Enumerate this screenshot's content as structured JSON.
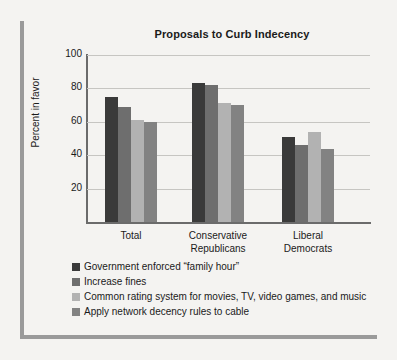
{
  "chart_data": {
    "type": "bar",
    "title": "Proposals to Curb Indecency",
    "xlabel": "",
    "ylabel": "Percent in favor",
    "ylim": [
      0,
      100
    ],
    "yticks": [
      20,
      40,
      60,
      80,
      100
    ],
    "ytick_labels": [
      "20",
      "40",
      "60",
      "80",
      "100"
    ],
    "grid": true,
    "legend_position": "bottom-left",
    "categories": [
      "Total",
      "Conservative Republicans",
      "Liberal Democrats"
    ],
    "category_lines": [
      [
        "Total"
      ],
      [
        "Conservative",
        "Republicans"
      ],
      [
        "Liberal",
        "Democrats"
      ]
    ],
    "series": [
      {
        "name": "Government enforced “family hour”",
        "color": "#3a3a3a",
        "values": [
          75,
          83,
          51
        ]
      },
      {
        "name": "Increase fines",
        "color": "#6e6e6e",
        "values": [
          69,
          82,
          46
        ]
      },
      {
        "name": "Common rating system for movies, TV, video games, and music",
        "color": "#b2b2b2",
        "values": [
          61,
          71,
          54
        ]
      },
      {
        "name": "Apply network decency rules to cable",
        "color": "#828282",
        "values": [
          60,
          70,
          44
        ]
      }
    ]
  },
  "colors": {
    "background": "#f4f3f1",
    "rule": "#9a9a9a",
    "axis": "#6b6b6b",
    "gridline": "#c6c5c2",
    "text": "#1a1a1a"
  }
}
